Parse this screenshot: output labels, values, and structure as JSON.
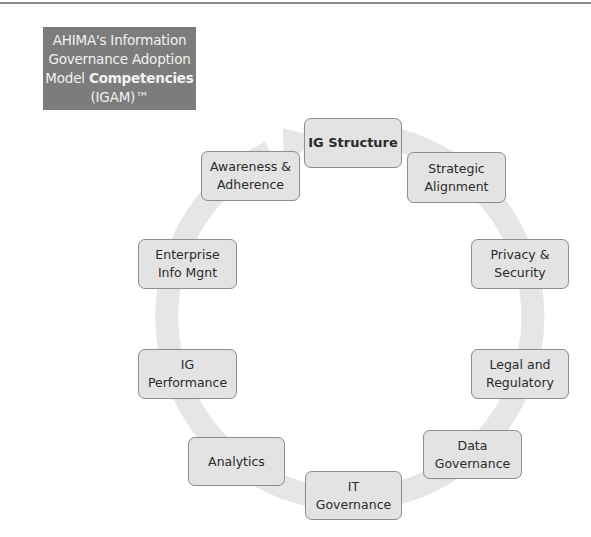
{
  "title": {
    "line1": "AHIMA's Information",
    "line2": "Governance Adoption",
    "line3_prefix": "Model ",
    "line3_bold": "Competencies",
    "line4": "(IGAM)™"
  },
  "colors": {
    "title_bg": "#7c7c7c",
    "title_text": "#f2f2f2",
    "ring": "#e6e6e6",
    "node_fill": "#e3e3e3",
    "node_border": "#8e8e8e",
    "node_text": "#2a2a2a"
  },
  "cycle": {
    "direction": "clockwise",
    "nodes": [
      {
        "id": "ig-structure",
        "line1": "IG Structure",
        "line2": "",
        "emphasis": true
      },
      {
        "id": "strategic-alignment",
        "line1": "Strategic",
        "line2": "Alignment"
      },
      {
        "id": "privacy-security",
        "line1": "Privacy &",
        "line2": "Security"
      },
      {
        "id": "legal-regulatory",
        "line1": "Legal and",
        "line2": "Regulatory"
      },
      {
        "id": "data-governance",
        "line1": "Data",
        "line2": "Governance"
      },
      {
        "id": "it-governance",
        "line1": "IT",
        "line2": "Governance"
      },
      {
        "id": "analytics",
        "line1": "Analytics",
        "line2": ""
      },
      {
        "id": "ig-performance",
        "line1": "IG",
        "line2": "Performance"
      },
      {
        "id": "enterprise-info-mgnt",
        "line1": "Enterprise",
        "line2": "Info Mgnt"
      },
      {
        "id": "awareness-adherence",
        "line1": "Awareness &",
        "line2": "Adherence"
      }
    ]
  }
}
